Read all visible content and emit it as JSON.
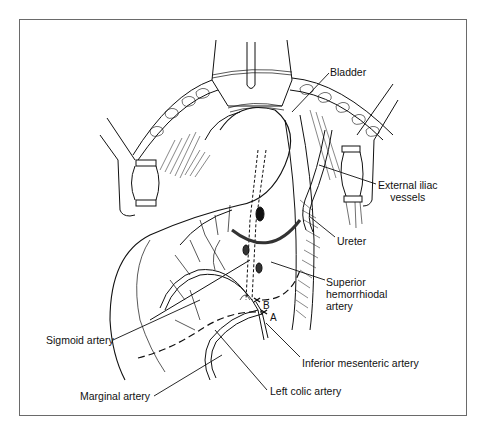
{
  "figure": {
    "type": "surgical-illustration",
    "labels": {
      "bladder": "Bladder",
      "external_iliac": "External iliac\nvessels",
      "ureter": "Ureter",
      "superior_hemorrhoidal": "Superior\nhemorrhiodal\nartery",
      "sigmoid_artery": "Sigmoid artery",
      "inferior_mesenteric": "Inferior mesenteric artery",
      "marginal_artery": "Marginal artery",
      "left_colic": "Left colic artery",
      "point_a": "A",
      "point_b": "B"
    }
  }
}
